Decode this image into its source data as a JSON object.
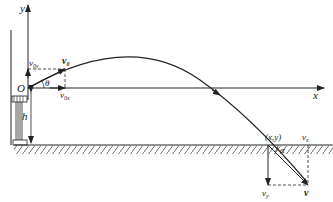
{
  "diagram": {
    "type": "projectile-motion",
    "axes": {
      "x_label": "x",
      "y_label": "y",
      "origin_label": "O"
    },
    "launch": {
      "velocity_label": "v",
      "velocity_sub": "0",
      "vx_label": "v",
      "vx_sub": "0x",
      "vy_label": "v",
      "vy_sub": "0y",
      "angle_label": "θ"
    },
    "height_label": "h",
    "landing": {
      "point_label": "(x,y)",
      "velocity_label": "v",
      "vx_label": "v",
      "vx_sub": "x",
      "vy_label": "v",
      "vy_sub": "y",
      "angle_label": "α"
    },
    "colors": {
      "line": "#222222",
      "background": "#ffffff"
    }
  }
}
